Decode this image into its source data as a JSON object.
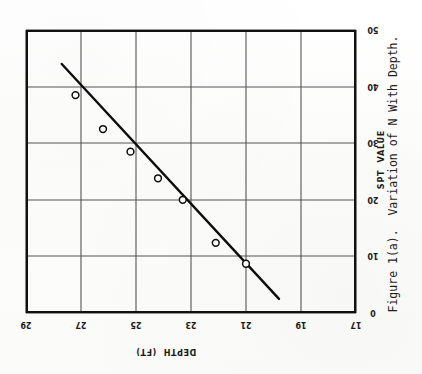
{
  "figure": {
    "caption": "Figure 1(a).  Variation of N With Depth.",
    "depth_axis_title": "DEPTH  (FT)",
    "spt_axis_title": "SPT  VALUE",
    "orientation": "rotated-90-ccw-scan",
    "background_color": "#fdfdfc",
    "ink_color": "#111111",
    "grid_color": "#555555"
  },
  "axes": {
    "depth_ticks": [
      "29",
      "27",
      "25",
      "23",
      "21",
      "19",
      "17"
    ],
    "spt_ticks": [
      "0",
      "10",
      "20",
      "30",
      "40",
      "50"
    ]
  },
  "chart_data": {
    "type": "scatter",
    "title": "Figure 1(a).  Variation of N With Depth.",
    "xlabel": "SPT  VALUE",
    "ylabel": "DEPTH  (FT)",
    "xlim": [
      0,
      50
    ],
    "ylim": [
      17,
      29
    ],
    "grid": true,
    "legend": null,
    "x": [
      38.5,
      32.5,
      28.5,
      23.8,
      20.0,
      12.4,
      8.7
    ],
    "y": [
      27.2,
      26.2,
      25.2,
      24.2,
      23.3,
      22.1,
      21.0
    ],
    "xticks": [
      0,
      10,
      20,
      30,
      40,
      50
    ],
    "yticks": [
      17,
      19,
      21,
      23,
      25,
      27,
      29
    ],
    "series": [
      {
        "name": "SPT data points",
        "marker": "open-circle",
        "points": [
          {
            "spt": 38.5,
            "depth": 27.2
          },
          {
            "spt": 32.5,
            "depth": 26.2
          },
          {
            "spt": 28.5,
            "depth": 25.2
          },
          {
            "spt": 23.8,
            "depth": 24.2
          },
          {
            "spt": 20.0,
            "depth": 23.3
          },
          {
            "spt": 12.4,
            "depth": 22.1
          },
          {
            "spt": 8.7,
            "depth": 21.0
          }
        ]
      },
      {
        "name": "best-fit line",
        "marker": "none",
        "points": [
          {
            "spt": 44.0,
            "depth": 27.7
          },
          {
            "spt": 2.5,
            "depth": 19.8
          }
        ]
      }
    ]
  }
}
